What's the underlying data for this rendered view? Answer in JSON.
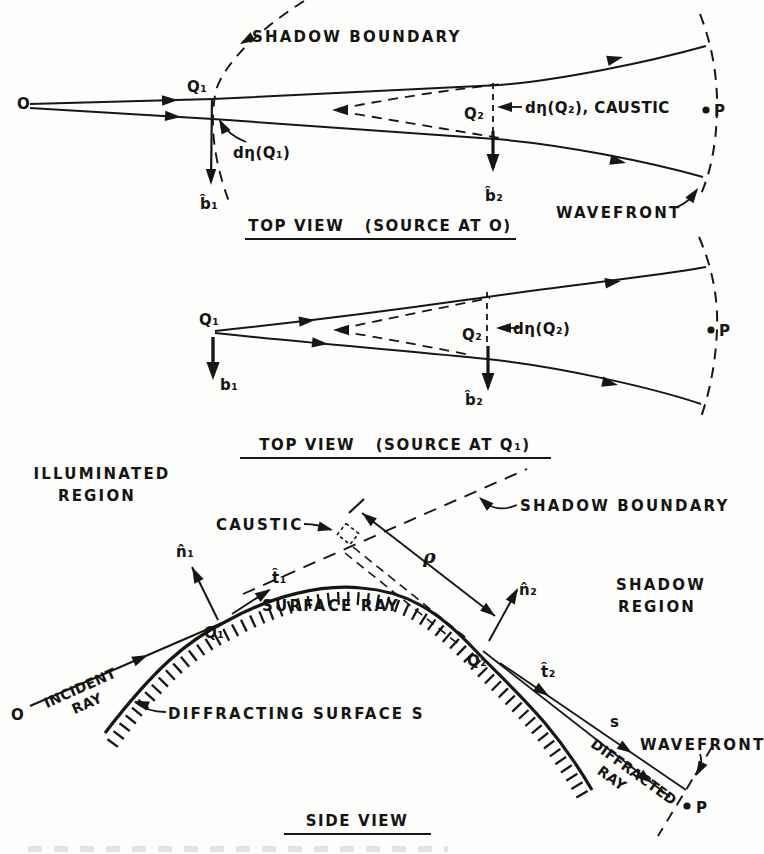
{
  "figure": {
    "ink_color": "#161616",
    "paper_color": "#fdfdfb",
    "diagram1": {
      "labels": {
        "shadow_boundary": "SHADOW BOUNDARY",
        "source": "O",
        "q1": "Q₁",
        "dn_q1": "dη(Q₁)",
        "b1": "b̂₁",
        "q2": "Q₂",
        "dn_q2": "dη(Q₂), CAUSTIC",
        "b2": "b̂₂",
        "p": "P",
        "wavefront": "WAVEFRONT",
        "caption": "TOP VIEW   (SOURCE AT O)"
      }
    },
    "diagram2": {
      "labels": {
        "q1": "Q₁",
        "b1": "b₁",
        "q2": "Q₂",
        "dn_q2": "dη(Q₂)",
        "b2": "b̂₂",
        "p": "P",
        "caption": "TOP VIEW   (SOURCE AT Q₁)"
      }
    },
    "diagram3": {
      "labels": {
        "illuminated_line1": "ILLUMINATED",
        "illuminated_line2": "REGION",
        "caustic": "CAUSTIC",
        "shadow_boundary": "SHADOW BOUNDARY",
        "rho": "ρ",
        "n1": "n̂₁",
        "t1": "t̂₁",
        "n2": "n̂₂",
        "t2": "t̂₂",
        "surface_ray": "SURFACE RAY",
        "shadow_line1": "SHADOW",
        "shadow_line2": "REGION",
        "q1": "Q₁",
        "q2": "Q₂",
        "source": "O",
        "incident_line1": "INCIDENT",
        "incident_line2": "RAY",
        "diffracting_surface": "DIFFRACTING SURFACE S",
        "s": "s",
        "diffracted_line1": "DIFFRACTED",
        "diffracted_line2": "RAY",
        "wavefront": "WAVEFRONT",
        "p": "P",
        "caption": "SIDE VIEW"
      }
    }
  }
}
